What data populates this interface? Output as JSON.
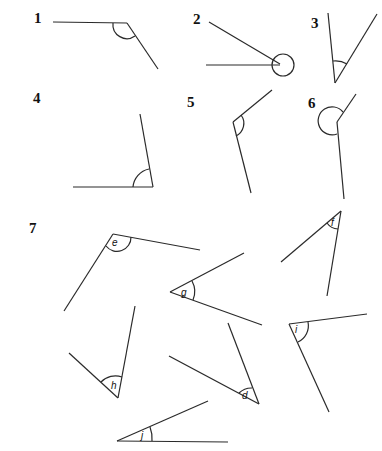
{
  "worksheet": {
    "questions": [
      {
        "number": "1"
      },
      {
        "number": "2"
      },
      {
        "number": "3"
      },
      {
        "number": "4"
      },
      {
        "number": "5"
      },
      {
        "number": "6"
      },
      {
        "number": "7"
      }
    ],
    "angle_labels": {
      "e": "e",
      "f": "f",
      "g": "g",
      "h": "h",
      "i": "i",
      "d": "d",
      "j": "j"
    },
    "colors": {
      "ink": "#2a2a2a",
      "background": "#ffffff"
    }
  }
}
